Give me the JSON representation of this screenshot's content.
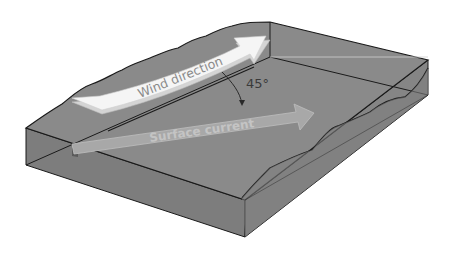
{
  "diagram": {
    "labels": {
      "wind": "Wind direction",
      "current": "Surface current",
      "angle": "45°"
    },
    "colors": {
      "background": "#ffffff",
      "water_top": "#8a8a8a",
      "water_side_front": "#7d7d7d",
      "water_side_right": "#858585",
      "outline": "#1a1a1a",
      "wind_arrow_fill": "#f4f4f4",
      "wind_arrow_edge": "#d8d8d8",
      "wind_label": "#8a8a8a",
      "current_arrow_fill": "#a6a6a6",
      "current_arrow_edge": "#bcbcbc",
      "current_label": "#c6c6c6",
      "angle_label": "#3a3a3a"
    }
  }
}
